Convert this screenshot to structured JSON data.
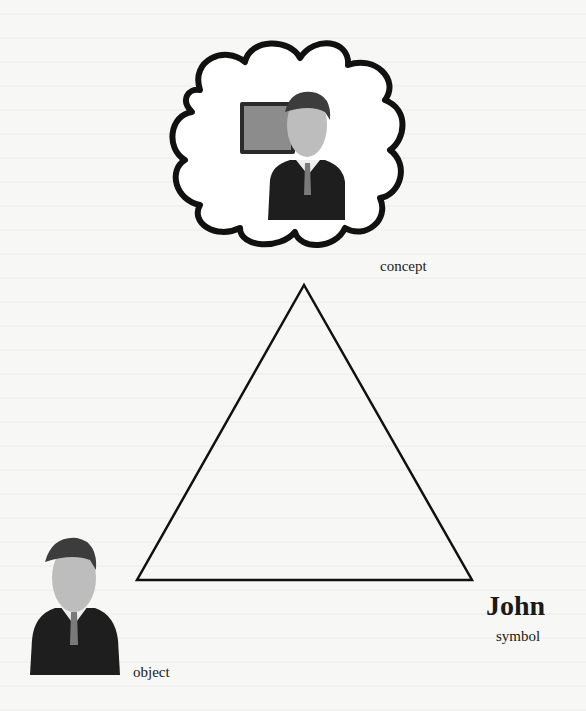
{
  "diagram": {
    "type": "semiotic-triangle",
    "nodes": {
      "concept": {
        "label": "concept",
        "icon": "thought-cloud-person-with-monitor"
      },
      "object": {
        "label": "object",
        "icon": "businessman-avatar"
      },
      "symbol": {
        "word": "John",
        "label": "symbol"
      }
    },
    "triangle": {
      "apex": [
        304,
        285
      ],
      "bottom_left": [
        137,
        580
      ],
      "bottom_right": [
        472,
        580
      ]
    },
    "colors": {
      "stroke": "#111111",
      "background": "#f7f7f5"
    }
  }
}
